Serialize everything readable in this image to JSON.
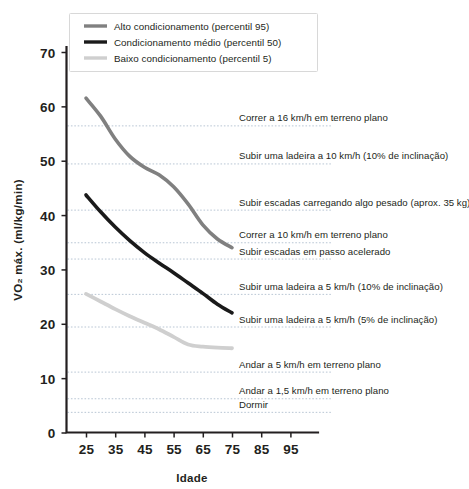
{
  "chart_data": {
    "type": "line",
    "title": "",
    "xlabel": "Idade",
    "ylabel": "VO₂ máx. (ml/kg/min)",
    "xlim": [
      20,
      100
    ],
    "ylim": [
      0,
      72
    ],
    "xticks": [
      25,
      35,
      45,
      55,
      65,
      75,
      85,
      95
    ],
    "yticks": [
      0,
      10,
      20,
      30,
      40,
      50,
      60,
      70
    ],
    "grid": false,
    "legend_position": "top-left",
    "series": [
      {
        "name": "Alto condicionamento (percentil 95)",
        "color": "#808080",
        "x": [
          25,
          30,
          35,
          40,
          45,
          50,
          55,
          60,
          65,
          70,
          75
        ],
        "values": [
          61.5,
          58.2,
          54.0,
          50.8,
          48.8,
          47.4,
          45.2,
          42.0,
          38.2,
          35.6,
          34.0
        ]
      },
      {
        "name": "Condicionamento médio (percentil 50)",
        "color": "#1a1a1a",
        "x": [
          25,
          30,
          35,
          40,
          45,
          50,
          55,
          60,
          65,
          70,
          75
        ],
        "values": [
          43.7,
          40.6,
          37.8,
          35.3,
          33.1,
          31.2,
          29.4,
          27.5,
          25.6,
          23.6,
          22.0
        ]
      },
      {
        "name": "Baixo condicionamento (percentil 5)",
        "color": "#cfcfcf",
        "x": [
          25,
          30,
          35,
          40,
          45,
          50,
          55,
          60,
          65,
          70,
          75
        ],
        "values": [
          25.5,
          24.1,
          22.7,
          21.4,
          20.2,
          19.0,
          17.6,
          16.2,
          15.8,
          15.6,
          15.5
        ]
      }
    ],
    "reference_lines": [
      {
        "value": 56.5,
        "label": "Correr a 16 km/h em terreno plano"
      },
      {
        "value": 49.5,
        "label": "Subir uma ladeira a 10 km/h (10% de inclinação)"
      },
      {
        "value": 41.0,
        "label": "Subir escadas carregando algo pesado (aprox. 35 kg)"
      },
      {
        "value": 35.0,
        "label": "Correr a 10 km/h em terreno plano"
      },
      {
        "value": 32.0,
        "label": "Subir escadas em passo acelerado"
      },
      {
        "value": 25.5,
        "label": "Subir uma ladeira a 5 km/h (10% de inclinação)"
      },
      {
        "value": 19.5,
        "label": "Subir uma ladeira a 5 km/h (5% de inclinação)"
      },
      {
        "value": 11.2,
        "label": "Andar a 5 km/h em terreno plano"
      },
      {
        "value": 6.3,
        "label": "Andar a 1,5 km/h em terreno plano"
      },
      {
        "value": 3.8,
        "label": "Dormir"
      }
    ]
  },
  "legend": {
    "items": [
      {
        "label": "Alto condicionamento (percentil 95)",
        "color": "#808080"
      },
      {
        "label": "Condicionamento médio (percentil 50)",
        "color": "#1a1a1a"
      },
      {
        "label": "Baixo condicionamento (percentil 5)",
        "color": "#cfcfcf"
      }
    ]
  },
  "axes": {
    "y_title": "VO₂ máx. (ml/kg/min)",
    "x_title": "Idade",
    "y_tick_labels": [
      "70",
      "60",
      "50",
      "40",
      "30",
      "20",
      "10",
      "0"
    ],
    "x_tick_labels": [
      "25",
      "35",
      "45",
      "55",
      "65",
      "75",
      "85",
      "95"
    ]
  },
  "colors": {
    "axis": "#231f20",
    "refline": "#b9c6d4",
    "high_fitness": "#808080",
    "medium_fitness": "#1a1a1a",
    "low_fitness": "#cfcfcf",
    "background": "#ffffff"
  }
}
